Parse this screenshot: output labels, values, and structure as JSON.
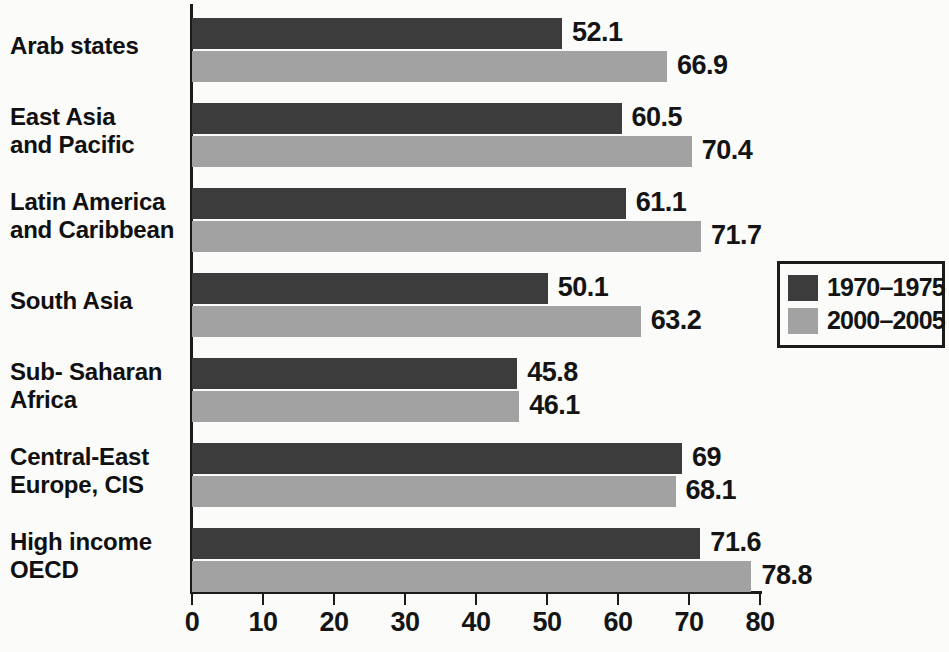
{
  "chart_data": {
    "type": "bar",
    "orientation": "horizontal",
    "title": "",
    "xlabel": "",
    "ylabel": "",
    "xlim": [
      0,
      80
    ],
    "xticks": [
      0,
      10,
      20,
      30,
      40,
      50,
      60,
      70,
      80
    ],
    "grid": false,
    "legend_position": "right",
    "categories": [
      "Arab states",
      "East Asia and Pacific",
      "Latin America and Caribbean",
      "South Asia",
      "Sub- Saharan Africa",
      "Central-East Europe, CIS",
      "High income OECD"
    ],
    "category_lines": [
      [
        "Arab states"
      ],
      [
        "East Asia",
        "and Pacific"
      ],
      [
        "Latin America",
        "and Caribbean"
      ],
      [
        "South Asia"
      ],
      [
        "Sub- Saharan",
        "Africa"
      ],
      [
        "Central-East",
        "Europe, CIS"
      ],
      [
        "High income",
        "OECD"
      ]
    ],
    "series": [
      {
        "name": "1970–1975",
        "color": "#3c3c3c",
        "values": [
          52.1,
          60.5,
          61.1,
          50.1,
          45.8,
          69,
          71.6
        ],
        "labels": [
          "52.1",
          "60.5",
          "61.1",
          "50.1",
          "45.8",
          "69",
          "71.6"
        ]
      },
      {
        "name": "2000–2005",
        "color": "#a2a2a2",
        "values": [
          66.9,
          70.4,
          71.7,
          63.2,
          46.1,
          68.1,
          78.8
        ],
        "labels": [
          "66.9",
          "70.4",
          "71.7",
          "63.2",
          "46.1",
          "68.1",
          "78.8"
        ]
      }
    ]
  },
  "legend": {
    "items": [
      {
        "label": "1970–1975",
        "swatch": "#3c3c3c"
      },
      {
        "label": "2000–2005",
        "swatch": "#a2a2a2"
      }
    ]
  },
  "axis": {
    "tick_labels": [
      "0",
      "10",
      "20",
      "30",
      "40",
      "50",
      "60",
      "70",
      "80"
    ]
  }
}
